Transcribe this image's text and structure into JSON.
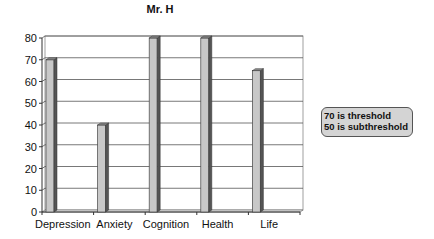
{
  "chart_data": {
    "type": "bar",
    "title": "Mr. H",
    "categories": [
      "Depression",
      "Anxiety",
      "Cognition",
      "Health",
      "Life"
    ],
    "values": [
      70,
      40,
      80,
      80,
      65
    ],
    "xlabel": "",
    "ylabel": "",
    "ylim": [
      0,
      80
    ],
    "yticks": [
      0,
      10,
      20,
      30,
      40,
      50,
      60,
      70,
      80
    ],
    "grid": true,
    "style": "3d-column",
    "bar_color": "#c8c8c8",
    "annotation": [
      "70 is threshold",
      "50 is subthreshold"
    ],
    "legend_position": "right"
  },
  "annotation_box": {
    "line1": "70 is threshold",
    "line2": "50 is subthreshold"
  }
}
